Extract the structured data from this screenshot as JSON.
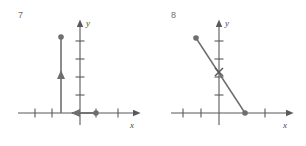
{
  "page": {
    "background_color": "#ffffff",
    "ink_color": "#59595b",
    "label_color": "#6e6e6e",
    "width": 306,
    "height": 146
  },
  "figures": [
    {
      "number": "7",
      "axis_labels": {
        "x": "x",
        "y": "y"
      },
      "graph_data": {
        "type": "piecewise-rays",
        "description": "Vertical ray rising from the x-axis plus a horizontal ray on the x-axis",
        "xlim": [
          -5,
          5
        ],
        "ylim": [
          -1.5,
          5
        ],
        "x_ticks": [
          -3,
          -2,
          1,
          3
        ],
        "y_ticks": [
          1,
          2,
          3,
          4
        ],
        "grid": false,
        "segments": [
          {
            "name": "vertical-ray",
            "from": [
              -2,
              0
            ],
            "to": [
              -2,
              4
            ],
            "endpoint_marker": "filled-dot",
            "endpoint_at": [
              -2,
              4
            ],
            "direction_arrow": "up",
            "arrow_at": [
              -2,
              2
            ]
          },
          {
            "name": "horizontal-ray",
            "from": [
              1,
              0
            ],
            "to": [
              -0.2,
              0
            ],
            "endpoint_marker": "filled-dot",
            "endpoint_at": [
              1,
              0
            ],
            "direction_arrow": "left",
            "arrow_at": [
              -0.1,
              0
            ]
          }
        ]
      }
    },
    {
      "number": "8",
      "axis_labels": {
        "x": "x",
        "y": "y"
      },
      "graph_data": {
        "type": "line-segment",
        "description": "Steeply decreasing segment from upper left to the x-axis",
        "xlim": [
          -5,
          5
        ],
        "ylim": [
          -1.5,
          5
        ],
        "x_ticks": [
          -3,
          -2,
          1,
          3
        ],
        "y_ticks": [
          1,
          2,
          3,
          4
        ],
        "grid": false,
        "segments": [
          {
            "name": "decreasing-segment",
            "from": [
              -1.5,
              4
            ],
            "to": [
              1,
              0
            ],
            "slope": -1.6,
            "endpoint_markers": [
              "filled-dot",
              "filled-dot"
            ],
            "intercept_marker": "x-cross",
            "intercept_at": [
              0,
              1.6
            ]
          }
        ]
      }
    }
  ]
}
